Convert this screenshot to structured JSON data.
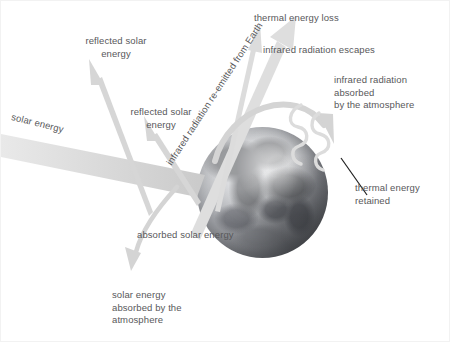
{
  "diagram": {
    "subject": "Earth",
    "background_color": "#ffffff",
    "text_color": "#58585a",
    "arrow_color": "#cfcfcf",
    "beam_color": "#dcdcdc",
    "leader_color": "#1a1a1a"
  },
  "labels": {
    "reflected_solar_energy_upper": "reflected solar\nenergy",
    "reflected_solar_energy_lower": "reflected solar\nenergy",
    "solar_energy": "solar energy",
    "infrared_reemitted": "infrared radiation re-emitted from Earth",
    "thermal_energy_loss": "thermal energy loss",
    "infrared_radiation_escapes": "infrared radiation escapes",
    "infrared_absorbed_atmosphere": "infrared radiation absorbed\nby the atmosphere",
    "thermal_energy_retained": "thermal energy\nretained",
    "absorbed_solar_energy": "absorbed solar energy",
    "solar_energy_absorbed_atmosphere": "solar energy\nabsorbed by the\natmosphere"
  }
}
